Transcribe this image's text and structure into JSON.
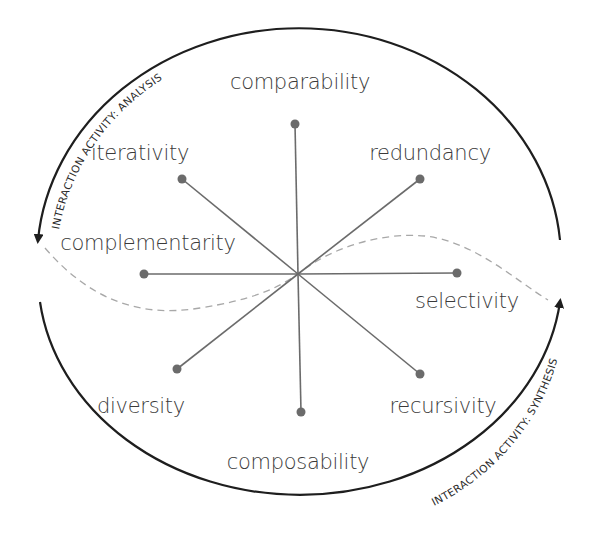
{
  "diagram": {
    "center": {
      "x": 298,
      "y": 274
    },
    "colors": {
      "spoke": "#6b6b6b",
      "arc": "#1e1e1e",
      "dashed_curve": "#a8a8a8",
      "label": "#3a3a3a"
    },
    "dimensions": [
      {
        "label": "comparability",
        "direction": "up"
      },
      {
        "label": "redundancy",
        "direction": "up-right"
      },
      {
        "label": "selectivity",
        "direction": "right"
      },
      {
        "label": "recursivity",
        "direction": "down-right"
      },
      {
        "label": "composability",
        "direction": "down"
      },
      {
        "label": "diversity",
        "direction": "down-left"
      },
      {
        "label": "complementarity",
        "direction": "left"
      },
      {
        "label": "iterativity",
        "direction": "up-left"
      }
    ],
    "arcs": {
      "top": {
        "label": "Interaction activity: Analysis",
        "arrow": "down-left"
      },
      "bottom": {
        "label": "Interaction activity: Synthesis",
        "arrow": "up-right"
      }
    }
  }
}
